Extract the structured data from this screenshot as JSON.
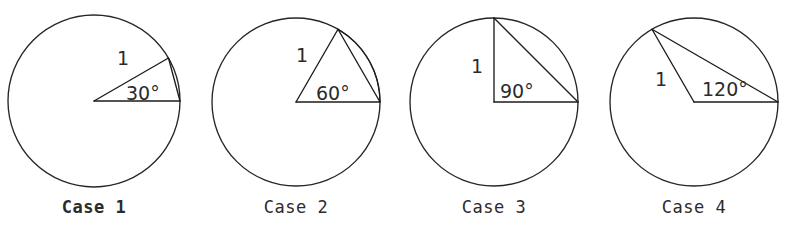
{
  "figure": {
    "background_color": "#ffffff",
    "stroke_color": "#1c1c1c",
    "text_color": "#2b2b2b",
    "radius_label_default": "1",
    "degree_symbol": "°"
  },
  "cases": [
    {
      "id": "case-1",
      "caption": "Case 1",
      "caption_prefix_bold": "Cas",
      "caption_rest": "e 1",
      "angle_label": "30°",
      "angle_degrees": 30,
      "radius_label": "1",
      "circle": {
        "cx": 94,
        "cy": 101,
        "r": 86
      },
      "vertex": {
        "x": 94,
        "y": 101
      },
      "label_positions": {
        "radius": {
          "x": 123,
          "y": 65
        },
        "angle": {
          "x": 126,
          "y": 100
        },
        "caption": {
          "x": 94,
          "y": 213
        }
      },
      "emphasized": true
    },
    {
      "id": "case-2",
      "caption": "Case 2",
      "caption_prefix_bold": "",
      "caption_rest": "Case 2",
      "angle_label": "60°",
      "angle_degrees": 60,
      "radius_label": "1",
      "circle": {
        "cx": 296,
        "cy": 102,
        "r": 84
      },
      "vertex": {
        "x": 296,
        "y": 102
      },
      "label_positions": {
        "radius": {
          "x": 302,
          "y": 62
        },
        "angle": {
          "x": 316,
          "y": 100
        },
        "caption": {
          "x": 296,
          "y": 213
        }
      },
      "emphasized": false
    },
    {
      "id": "case-3",
      "caption": "Case 3",
      "caption_prefix_bold": "",
      "caption_rest": "Case 3",
      "angle_label": "90°",
      "angle_degrees": 90,
      "radius_label": "1",
      "circle": {
        "cx": 494,
        "cy": 102,
        "r": 84
      },
      "vertex": {
        "x": 494,
        "y": 102
      },
      "label_positions": {
        "radius": {
          "x": 477,
          "y": 73
        },
        "angle": {
          "x": 500,
          "y": 98
        },
        "caption": {
          "x": 494,
          "y": 213
        }
      },
      "emphasized": false
    },
    {
      "id": "case-4",
      "caption": "Case 4",
      "caption_prefix_bold": "",
      "caption_rest": "Case 4",
      "angle_label": "120°",
      "angle_degrees": 120,
      "radius_label": "1",
      "circle": {
        "cx": 694,
        "cy": 102,
        "r": 84
      },
      "vertex": {
        "x": 694,
        "y": 102
      },
      "label_positions": {
        "radius": {
          "x": 661,
          "y": 86
        },
        "angle": {
          "x": 702,
          "y": 96
        },
        "caption": {
          "x": 694,
          "y": 213
        }
      },
      "emphasized": false
    }
  ]
}
